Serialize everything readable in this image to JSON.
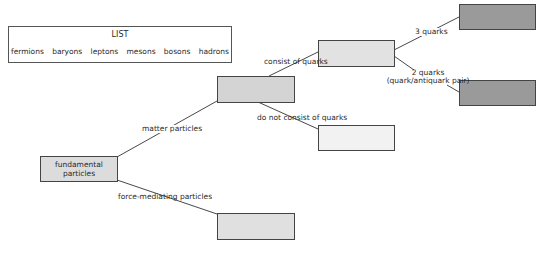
{
  "list": {
    "title": "LIST",
    "items": [
      "fermions",
      "baryons",
      "leptons",
      "mesons",
      "bosons",
      "hadrons"
    ]
  },
  "nodes": {
    "root": {
      "label": "fundamental particles",
      "fill": "#dcdcdc"
    },
    "matter": {
      "label": "",
      "fill": "#d4d4d4"
    },
    "force": {
      "label": "",
      "fill": "#e0e0e0"
    },
    "quarks": {
      "label": "",
      "fill": "#e2e2e2"
    },
    "no_quarks": {
      "label": "",
      "fill": "#f2f2f2"
    },
    "three_quarks": {
      "label": "",
      "fill": "#9a9a9a"
    },
    "two_quarks": {
      "label": "",
      "fill": "#9a9a9a"
    }
  },
  "edges": {
    "matter_particles": "matter particles",
    "force_mediating": "force-mediating particles",
    "consist_of_quarks": "consist of quarks",
    "do_not_consist": "do not consist of quarks",
    "three_quarks": "3 quarks",
    "two_quarks_line1": "2 quarks",
    "two_quarks_line2": "(quark/antiquark pair)"
  }
}
